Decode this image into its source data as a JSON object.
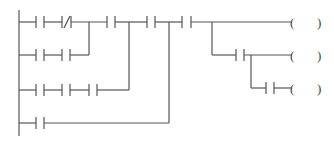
{
  "diagram": {
    "type": "ladder-logic",
    "left_rail": {
      "x": 19,
      "y1": 10,
      "y2": 136
    },
    "rows": [
      {
        "id": "row-1",
        "y": 22,
        "contacts": [
          "NO",
          "NC",
          "NO",
          "NO",
          "NO"
        ]
      },
      {
        "id": "row-2",
        "y": 55,
        "contacts": [
          "NO",
          "NO",
          "NO"
        ]
      },
      {
        "id": "row-3",
        "y": 90,
        "contacts": [
          "NO",
          "NO",
          "NO",
          "NO"
        ]
      },
      {
        "id": "row-4",
        "y": 123,
        "contacts": [
          "NO"
        ]
      }
    ],
    "outputs": [
      {
        "id": "coil-1",
        "label": "(   )",
        "y": 22
      },
      {
        "id": "coil-2",
        "label": "(   )",
        "y": 55
      },
      {
        "id": "coil-3",
        "label": "(   )",
        "y": 88
      }
    ],
    "coil_open": "(",
    "coil_close": ")",
    "line_color": "#555555"
  }
}
